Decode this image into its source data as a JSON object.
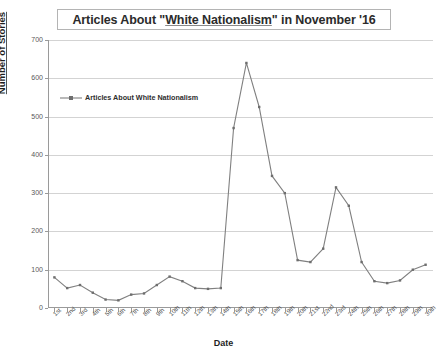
{
  "title": {
    "prefix": "Articles About \"",
    "flagged": "White Nationalism",
    "suffix": "\" in November '16"
  },
  "axes": {
    "x_label": "Date",
    "y_label": "Number of Stories",
    "y_ticks": [
      "0",
      "100",
      "200",
      "300",
      "400",
      "500",
      "600",
      "700"
    ],
    "y_min": 0,
    "y_max": 700
  },
  "legend": {
    "label": "Articles About White Nationalism",
    "symbol": "line-marker-icon",
    "position": "inside-top-left"
  },
  "style": {
    "series_color": "#808080",
    "grid_color": "#d3d3d3",
    "axis_color": "#9a9a9a",
    "background": "#ffffff"
  },
  "chart_data": {
    "type": "line",
    "title": "Articles About \"White Nationalism\" in November '16",
    "xlabel": "Date",
    "ylabel": "Number of Stories",
    "ylim": [
      0,
      700
    ],
    "grid": true,
    "legend_position": "inside-top-left",
    "categories": [
      "1st",
      "2nd",
      "3rd",
      "4th",
      "5th",
      "6th",
      "7th",
      "8th",
      "9th",
      "10th",
      "11th",
      "12th",
      "13th",
      "14th",
      "15th",
      "16th",
      "17th",
      "18th",
      "19th",
      "20th",
      "21st",
      "22nd",
      "23rd",
      "24th",
      "25th",
      "26th",
      "27th",
      "28th",
      "29th",
      "30th"
    ],
    "series": [
      {
        "name": "Articles About White Nationalism",
        "values": [
          80,
          52,
          60,
          40,
          22,
          20,
          35,
          38,
          60,
          82,
          70,
          52,
          50,
          52,
          470,
          640,
          525,
          345,
          300,
          125,
          120,
          155,
          315,
          267,
          120,
          70,
          65,
          72,
          100,
          113
        ]
      }
    ]
  }
}
